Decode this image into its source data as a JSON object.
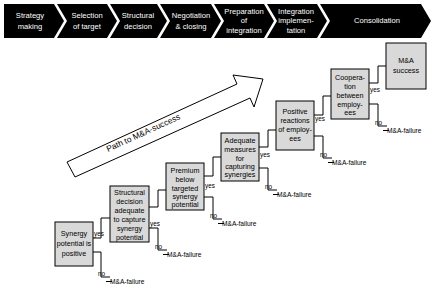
{
  "diagram": {
    "phase_band": {
      "name": "m-and-a-process-phases",
      "background": "#000000",
      "text_color": "#ffffff",
      "phases": [
        {
          "id": "strategy-making",
          "lines": [
            "Strategy",
            "making"
          ]
        },
        {
          "id": "selection-of-target",
          "lines": [
            "Selection",
            "of target"
          ]
        },
        {
          "id": "structural-decision",
          "lines": [
            "Structural",
            "decision"
          ]
        },
        {
          "id": "negotiation-closing",
          "lines": [
            "Negotiation",
            "& closing"
          ]
        },
        {
          "id": "preparation-of-integration",
          "lines": [
            "Preparation",
            "of",
            "integration"
          ]
        },
        {
          "id": "integration-implementation",
          "lines": [
            "Integration",
            "implemen-",
            "tation"
          ]
        },
        {
          "id": "consolidation",
          "lines": [
            "Consolidation"
          ]
        }
      ]
    },
    "path_arrow": {
      "label": "Path to M&A-success"
    },
    "labels": {
      "yes": "yes",
      "no": "no",
      "failure": "M&A-failure",
      "failure_prefix": "—"
    },
    "box_fill": "#d9d9d9",
    "decision_steps": [
      {
        "id": "synergy-potential-positive",
        "lines": [
          "Synergy",
          "potential is",
          "positive"
        ],
        "yes_label": "yes",
        "no_label": "no",
        "failure_label": "M&A-failure"
      },
      {
        "id": "structural-decision-adequate",
        "lines": [
          "Structural",
          "decision",
          "adequate",
          "to capture",
          "synergy",
          "potential"
        ],
        "yes_label": "yes",
        "no_label": "no",
        "failure_label": "M&A-failure"
      },
      {
        "id": "premium-below-targeted-synergy",
        "lines": [
          "Premium",
          "below",
          "targeted",
          "synergy",
          "potential"
        ],
        "yes_label": "yes",
        "no_label": "no",
        "failure_label": "M&A-failure"
      },
      {
        "id": "adequate-measures-capturing-synergies",
        "lines": [
          "Adequate",
          "measures",
          "for",
          "capturing",
          "synergies"
        ],
        "yes_label": "yes",
        "no_label": "no",
        "failure_label": "M&A-failure"
      },
      {
        "id": "positive-reactions-of-employees",
        "lines": [
          "Positive",
          "reactions",
          "of employ-",
          "ees"
        ],
        "yes_label": "yes",
        "no_label": "no",
        "failure_label": "M&A-failure"
      },
      {
        "id": "cooperation-between-employees",
        "lines": [
          "Coopera-",
          "tion",
          "between",
          "employ-",
          "ees"
        ],
        "yes_label": "yes",
        "no_label": "no",
        "failure_label": "M&A-failure"
      }
    ],
    "terminal": {
      "id": "m-and-a-success",
      "lines": [
        "M&A",
        "success"
      ]
    }
  }
}
